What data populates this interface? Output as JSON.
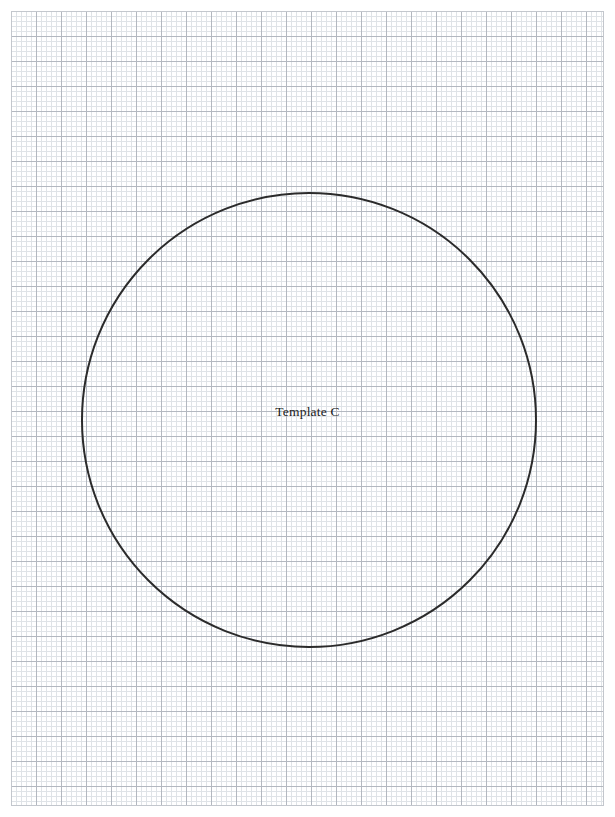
{
  "page": {
    "width": 615,
    "height": 817,
    "background_color": "#ffffff",
    "title": "Template C"
  },
  "graph_paper": {
    "name": "graph-paper",
    "x": 11,
    "y": 11,
    "width": 593,
    "height": 795,
    "fine_cell_px": 5,
    "major_cell_px": 25,
    "cells_per_major": 5,
    "fine_line_color": "#dfe3e7",
    "major_line_color": "#b3b8c0",
    "border_color": "#c3c7cd",
    "background_color": "#ffffff"
  },
  "shapes": {
    "circle": {
      "name": "template-circle",
      "center_x": 309,
      "center_y": 420,
      "radius": 227,
      "stroke_color": "#2b2b2b",
      "stroke_width": 2,
      "fill": "none"
    }
  },
  "labels": {
    "template_label": "Template C",
    "template_label_x": 309,
    "template_label_y": 414,
    "template_label_color": "#1c1c1c",
    "template_label_size": 13.5
  }
}
